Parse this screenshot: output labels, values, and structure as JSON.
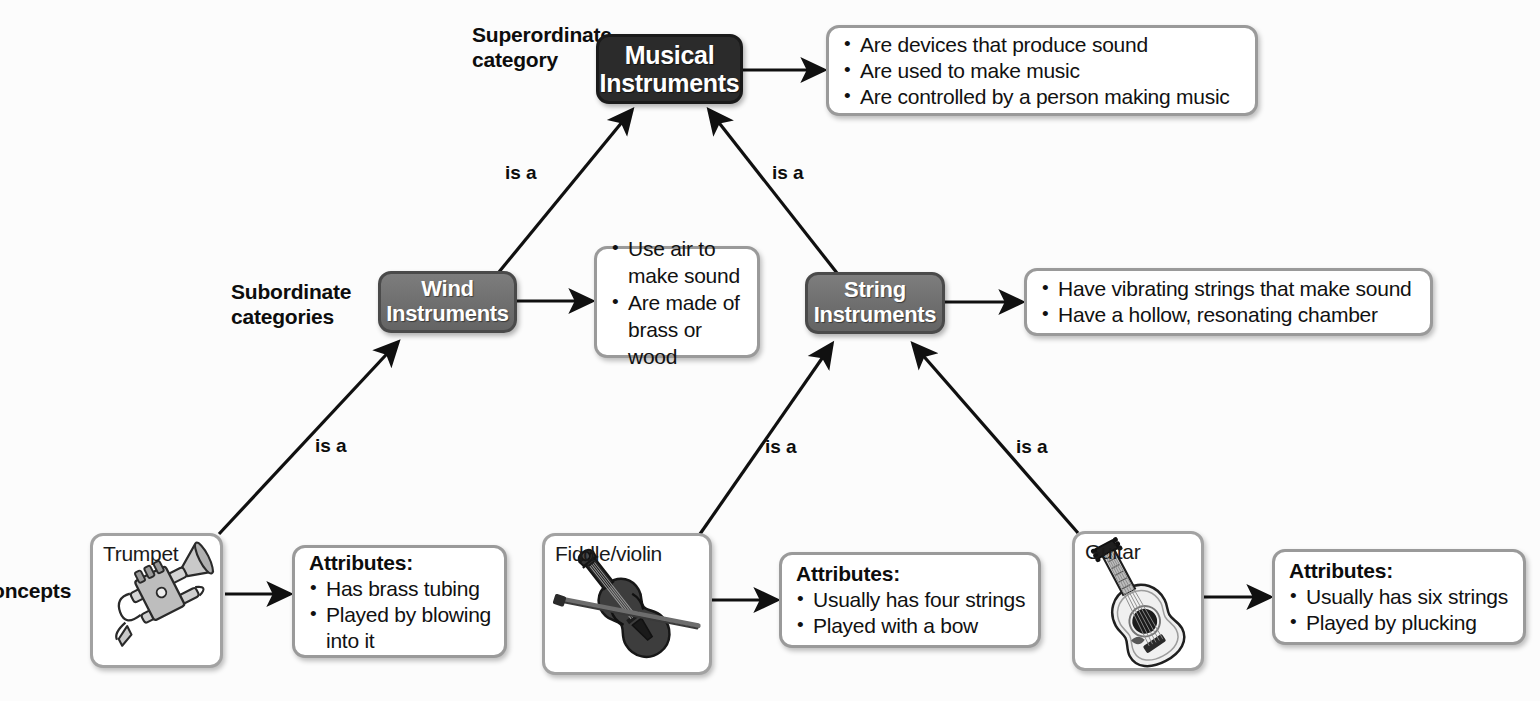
{
  "diagram": {
    "background_color": "#fcfcfc",
    "superordinate_color": "#2b2b2b",
    "subordinate_color": "#6e6e6e",
    "box_border_color": "#9a9a9a",
    "edge_color": "#101010"
  },
  "side_labels": {
    "superordinate": "Superordinate\ncategory",
    "subordinate": "Subordinate\ncategories",
    "concepts": "oncepts"
  },
  "nodes": {
    "musical_instruments": {
      "label": "Musical\nInstruments",
      "level": "superordinate"
    },
    "wind_instruments": {
      "label": "Wind\nInstruments",
      "level": "subordinate"
    },
    "string_instruments": {
      "label": "String\nInstruments",
      "level": "subordinate"
    }
  },
  "fact_boxes": {
    "musical_instruments": {
      "title": "",
      "items": [
        "Are devices that produce sound",
        "Are used to make music",
        "Are controlled by a person making music"
      ]
    },
    "wind_instruments": {
      "title": "",
      "items": [
        "Use air to\nmake sound",
        "Are made of\nbrass or wood"
      ]
    },
    "string_instruments": {
      "title": "",
      "items": [
        "Have vibrating strings that make sound",
        "Have a hollow, resonating chamber"
      ]
    },
    "trumpet": {
      "title": "Attributes:",
      "items": [
        "Has brass tubing",
        "Played by blowing\ninto it"
      ]
    },
    "fiddle": {
      "title": "Attributes:",
      "items": [
        "Usually has four strings",
        "Played with a bow"
      ]
    },
    "guitar": {
      "title": "Attributes:",
      "items": [
        "Usually has six strings",
        "Played by plucking"
      ]
    }
  },
  "concepts": {
    "trumpet": {
      "label": "Trumpet",
      "icon": "trumpet-illustration"
    },
    "fiddle": {
      "label": "Fiddle/violin",
      "icon": "violin-illustration"
    },
    "guitar": {
      "label": "Guitar",
      "icon": "guitar-illustration"
    }
  },
  "edge_labels": {
    "wind_to_musical": "is a",
    "string_to_musical": "is a",
    "trumpet_to_wind": "is a",
    "fiddle_to_string": "is a",
    "guitar_to_string": "is a"
  }
}
